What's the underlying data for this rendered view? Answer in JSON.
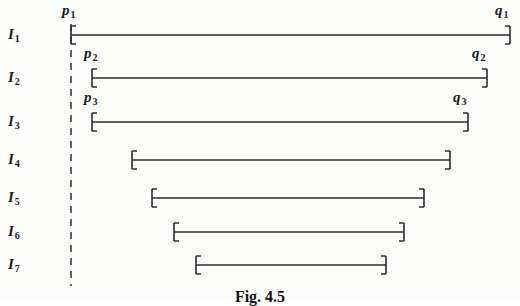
{
  "figure": {
    "caption": "Fig. 4.5",
    "caption_top": 288,
    "line_color": "#2b2b2b",
    "dash_color": "#3a3a3a",
    "text_color": "#1a1a1a",
    "background": "#fdfdfc",
    "width": 520,
    "height": 302,
    "dashed_line": {
      "name": "vertical-dashed-line-at-p1",
      "x": 71,
      "y_top": 24,
      "y_bottom": 286
    },
    "intervals": [
      {
        "id": "I1",
        "label": "I",
        "subscript": "1",
        "label_x": 8,
        "label_y": 26,
        "y": 35,
        "x_start": 71,
        "x_end": 510,
        "left_endpoint_label": "p",
        "left_endpoint_sub": "1",
        "left_label_x": 62,
        "left_label_y": 2,
        "right_endpoint_label": "q",
        "right_endpoint_sub": "1",
        "right_label_x": 495,
        "right_label_y": 2
      },
      {
        "id": "I2",
        "label": "I",
        "subscript": "2",
        "label_x": 8,
        "label_y": 69,
        "y": 78,
        "x_start": 92,
        "x_end": 487,
        "left_endpoint_label": "p",
        "left_endpoint_sub": "2",
        "left_label_x": 84,
        "left_label_y": 45,
        "right_endpoint_label": "q",
        "right_endpoint_sub": "2",
        "right_label_x": 472,
        "right_label_y": 45
      },
      {
        "id": "I3",
        "label": "I",
        "subscript": "3",
        "label_x": 8,
        "label_y": 113,
        "y": 122,
        "x_start": 92,
        "x_end": 468,
        "left_endpoint_label": "p",
        "left_endpoint_sub": "3",
        "left_label_x": 84,
        "left_label_y": 89,
        "right_endpoint_label": "q",
        "right_endpoint_sub": "3",
        "right_label_x": 453,
        "right_label_y": 89
      },
      {
        "id": "I4",
        "label": "I",
        "subscript": "4",
        "label_x": 8,
        "label_y": 151,
        "y": 160,
        "x_start": 132,
        "x_end": 450,
        "left_endpoint_label": "",
        "left_endpoint_sub": "",
        "right_endpoint_label": "",
        "right_endpoint_sub": ""
      },
      {
        "id": "I5",
        "label": "I",
        "subscript": "5",
        "label_x": 8,
        "label_y": 189,
        "y": 198,
        "x_start": 152,
        "x_end": 424,
        "left_endpoint_label": "",
        "left_endpoint_sub": "",
        "right_endpoint_label": "",
        "right_endpoint_sub": ""
      },
      {
        "id": "I6",
        "label": "I",
        "subscript": "6",
        "label_x": 8,
        "label_y": 223,
        "y": 232,
        "x_start": 174,
        "x_end": 404,
        "left_endpoint_label": "",
        "left_endpoint_sub": "",
        "right_endpoint_label": "",
        "right_endpoint_sub": ""
      },
      {
        "id": "I7",
        "label": "I",
        "subscript": "7",
        "label_x": 8,
        "label_y": 256,
        "y": 265,
        "x_start": 196,
        "x_end": 386,
        "left_endpoint_label": "",
        "left_endpoint_sub": "",
        "right_endpoint_label": "",
        "right_endpoint_sub": ""
      }
    ]
  }
}
